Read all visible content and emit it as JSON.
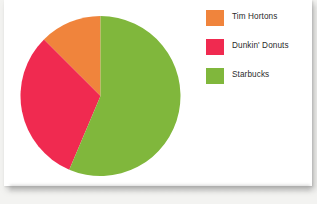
{
  "chart_data": {
    "type": "pie",
    "title": "",
    "subtitle": "",
    "xlabel": "",
    "ylabel": "",
    "grid": false,
    "legend_position": "right",
    "categories": [
      "Tim Hortons",
      "Dunkin' Donuts",
      "Starbucks"
    ],
    "values": [
      12.5,
      31.1,
      56.4
    ],
    "units": "percent",
    "colors": [
      "#F0843C",
      "#F02A50",
      "#80B73C"
    ],
    "slices": [
      {
        "label": "Tim Hortons",
        "value": 12.5,
        "color": "#F0843C",
        "start_angle_deg": 315,
        "end_angle_deg": 360
      },
      {
        "label": "Dunkin' Donuts",
        "value": 31.1,
        "color": "#F02A50",
        "start_angle_deg": 203,
        "end_angle_deg": 315
      },
      {
        "label": "Starbucks",
        "value": 56.4,
        "color": "#80B73C",
        "start_angle_deg": 0,
        "end_angle_deg": 203
      }
    ]
  },
  "legend": {
    "items": [
      {
        "label": "Tim Hortons",
        "color": "#F0843C",
        "swatch_name": "legend-swatch-tim-hortons"
      },
      {
        "label": "Dunkin' Donuts",
        "color": "#F02A50",
        "swatch_name": "legend-swatch-dunkin-donuts"
      },
      {
        "label": "Starbucks",
        "color": "#80B73C",
        "swatch_name": "legend-swatch-starbucks"
      }
    ]
  },
  "canvas": {
    "background_color": "#F3F3F1",
    "card_color": "#FFFFFF",
    "text_color": "#2B2B2B"
  },
  "geometry": {
    "center_x": 80.5,
    "center_y": 81,
    "radius": 80
  }
}
